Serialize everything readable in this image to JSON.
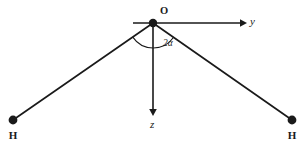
{
  "figure": {
    "name": "water-molecule-geometry",
    "background_color": "#ffffff",
    "stroke_color": "#1a1a1a",
    "width": 305,
    "height": 143
  },
  "origin": {
    "label": "O",
    "x": 153,
    "y": 23,
    "dot_radius": 4.2,
    "label_x": 160,
    "label_y": 14
  },
  "axes": {
    "y_axis": {
      "label": "y",
      "start_x": 133,
      "start_y": 23,
      "end_x": 243,
      "end_y": 23,
      "label_x": 250,
      "label_y": 25,
      "arrow": "right"
    },
    "z_axis": {
      "label": "z",
      "start_x": 153,
      "start_y": 23,
      "end_x": 153,
      "end_y": 112,
      "label_x": 151,
      "label_y": 127,
      "arrow": "down"
    }
  },
  "atoms": [
    {
      "label": "H",
      "name": "hydrogen-left",
      "x": 13,
      "y": 120,
      "dot_radius": 4.4,
      "label_x": 13,
      "label_y": 138
    },
    {
      "label": "H",
      "name": "hydrogen-right",
      "x": 292,
      "y": 120,
      "dot_radius": 4.4,
      "label_x": 292,
      "label_y": 138
    }
  ],
  "bonds": [
    {
      "name": "bond-left",
      "x1": 153,
      "y1": 23,
      "x2": 13,
      "y2": 120
    },
    {
      "name": "bond-right",
      "x1": 153,
      "y1": 23,
      "x2": 292,
      "y2": 120
    }
  ],
  "angle": {
    "label": "2α",
    "label_x": 163,
    "label_y": 45,
    "arc_radius": 25,
    "arc_center_x": 153,
    "arc_center_y": 23
  }
}
